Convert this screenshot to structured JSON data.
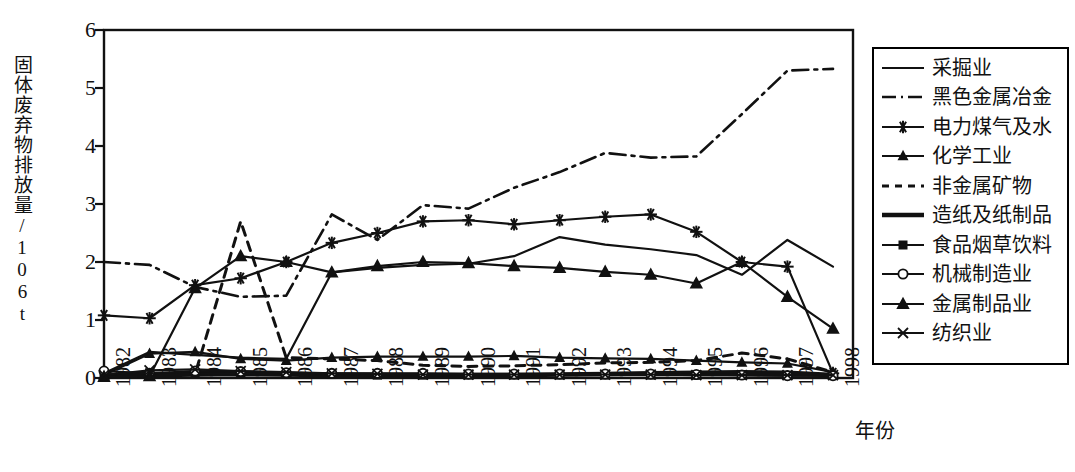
{
  "chart_data": {
    "type": "line",
    "title": "",
    "xlabel": "年份",
    "ylabel": "固体废弃物排放量/10⁶t",
    "ylabel_base": "固体废弃物排放量/10",
    "ylabel_sup": "6",
    "ylabel_unit": "t",
    "x": [
      1982,
      1983,
      1984,
      1985,
      1986,
      1987,
      1988,
      1989,
      1990,
      1991,
      1992,
      1993,
      1994,
      1995,
      1996,
      1997,
      1998
    ],
    "categories": [
      "1982",
      "1983",
      "1984",
      "1985",
      "1986",
      "1987",
      "1988",
      "1989",
      "1990",
      "1991",
      "1992",
      "1993",
      "1994",
      "1995",
      "1996",
      "1997",
      "1998"
    ],
    "xlim": [
      1982,
      1998
    ],
    "ylim": [
      0,
      6
    ],
    "yticks": [
      0,
      1,
      2,
      3,
      4,
      5,
      6
    ],
    "ytick_labels": [
      "0",
      "1",
      "2",
      "3",
      "4",
      "5",
      "6"
    ],
    "grid": false,
    "legend_position": "right-outside",
    "series": [
      {
        "name": "采掘业",
        "style": "solid",
        "marker": "none",
        "values": [
          0.08,
          0.45,
          0.4,
          0.35,
          0.33,
          1.82,
          1.9,
          1.95,
          1.97,
          2.1,
          2.43,
          2.3,
          2.22,
          2.12,
          1.78,
          2.38,
          1.92
        ]
      },
      {
        "name": "黑色金属冶金",
        "style": "dashdot",
        "marker": "none",
        "values": [
          2.0,
          1.95,
          1.57,
          1.4,
          1.42,
          2.82,
          2.38,
          2.98,
          2.92,
          3.28,
          3.55,
          3.88,
          3.8,
          3.82,
          4.55,
          5.3,
          5.33
        ]
      },
      {
        "name": "电力煤气及水",
        "style": "solid",
        "marker": "asterisk",
        "values": [
          1.08,
          1.03,
          1.6,
          1.72,
          2.0,
          2.33,
          2.5,
          2.7,
          2.72,
          2.65,
          2.72,
          2.78,
          2.82,
          2.52,
          2.0,
          1.92,
          0.08
        ]
      },
      {
        "name": "化学工业",
        "style": "solid",
        "marker": "triangle-small",
        "values": [
          0.05,
          0.42,
          0.45,
          0.33,
          0.3,
          0.35,
          0.37,
          0.37,
          0.37,
          0.38,
          0.35,
          0.34,
          0.33,
          0.3,
          0.27,
          0.25,
          0.1
        ]
      },
      {
        "name": "非金属矿物",
        "style": "dotted",
        "marker": "none",
        "values": [
          0.03,
          0.05,
          0.07,
          2.7,
          0.35,
          0.33,
          0.3,
          0.22,
          0.2,
          0.21,
          0.23,
          0.26,
          0.27,
          0.3,
          0.43,
          0.33,
          0.1
        ]
      },
      {
        "name": "造纸及纸制品",
        "style": "solid-thick",
        "marker": "none",
        "values": [
          0.04,
          0.05,
          0.06,
          0.07,
          0.06,
          0.05,
          0.05,
          0.05,
          0.05,
          0.05,
          0.06,
          0.07,
          0.08,
          0.09,
          0.1,
          0.09,
          0.05
        ]
      },
      {
        "name": "食品烟草饮料",
        "style": "solid",
        "marker": "square",
        "values": [
          0.06,
          0.09,
          0.09,
          0.08,
          0.07,
          0.06,
          0.05,
          0.05,
          0.05,
          0.05,
          0.05,
          0.05,
          0.05,
          0.05,
          0.05,
          0.04,
          0.04
        ]
      },
      {
        "name": "机械制造业",
        "style": "solid",
        "marker": "circle",
        "values": [
          0.12,
          0.08,
          0.12,
          0.11,
          0.09,
          0.08,
          0.08,
          0.08,
          0.07,
          0.07,
          0.07,
          0.07,
          0.07,
          0.06,
          0.05,
          0.04,
          0.04
        ]
      },
      {
        "name": "金属制品业",
        "style": "solid",
        "marker": "triangle",
        "values": [
          0.02,
          0.03,
          1.55,
          2.1,
          2.0,
          1.82,
          1.93,
          2.0,
          1.98,
          1.93,
          1.9,
          1.83,
          1.78,
          1.63,
          2.0,
          1.4,
          0.85
        ]
      },
      {
        "name": "纺织业",
        "style": "solid",
        "marker": "x",
        "values": [
          0.05,
          0.13,
          0.15,
          0.12,
          0.1,
          0.08,
          0.07,
          0.06,
          0.06,
          0.06,
          0.06,
          0.06,
          0.06,
          0.05,
          0.05,
          0.05,
          0.05
        ]
      }
    ]
  },
  "legend": {
    "items": [
      {
        "label": "采掘业",
        "swatch": "solid"
      },
      {
        "label": "黑色金属冶金",
        "swatch": "dashdot"
      },
      {
        "label": "电力煤气及水",
        "swatch": "asterisk"
      },
      {
        "label": "化学工业",
        "swatch": "triangle-small"
      },
      {
        "label": "非金属矿物",
        "swatch": "dotted"
      },
      {
        "label": "造纸及纸制品",
        "swatch": "solid-thick"
      },
      {
        "label": "食品烟草饮料",
        "swatch": "square"
      },
      {
        "label": "机械制造业",
        "swatch": "circle"
      },
      {
        "label": "金属制品业",
        "swatch": "triangle"
      },
      {
        "label": "纺织业",
        "swatch": "x"
      }
    ]
  },
  "colors": {
    "ink": "#111111",
    "background": "#ffffff"
  }
}
